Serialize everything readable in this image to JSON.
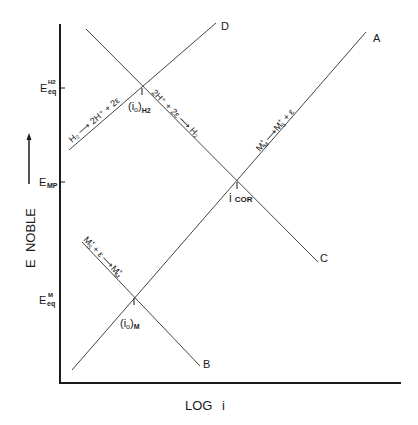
{
  "diagram": {
    "type": "evans-diagram",
    "axes": {
      "x_label": "LOG i",
      "y_label": "E  NOBLE",
      "y_ticks": [
        {
          "id": "eeq_h2",
          "main": "E",
          "sup": "H2",
          "sub": "eq",
          "y": 88
        },
        {
          "id": "emp",
          "main": "E",
          "sub": "MP",
          "y": 182
        },
        {
          "id": "eeq_m",
          "main": "E",
          "sup": "M",
          "sub": "eq",
          "y": 298
        }
      ]
    },
    "lines": [
      {
        "id": "A",
        "label": "A",
        "from": [
          72,
          370
        ],
        "to": [
          366,
          32
        ],
        "reaction": {
          "lhs": "M",
          "lhs_sup": "+",
          "lhs_sub": "M",
          "arrow": "⟶",
          "rhs": "M",
          "rhs_sup": "+",
          "rhs_sub": "S",
          "tail": "+ ε"
        }
      },
      {
        "id": "B",
        "label": "B",
        "from": [
          82,
          242
        ],
        "to": [
          200,
          366
        ],
        "reaction": {
          "lhs": "M",
          "lhs_sup": "+",
          "lhs_sub": "S",
          "mid": "+ ε",
          "arrow": "⟶",
          "rhs": "M",
          "rhs_sup": "+",
          "rhs_sub": "M"
        }
      },
      {
        "id": "C",
        "label": "C",
        "from": [
          86,
          29
        ],
        "to": [
          318,
          262
        ],
        "reaction": {
          "text": "2H⁺ + 2ε ⟶ H₂"
        }
      },
      {
        "id": "D",
        "label": "D",
        "from": [
          69,
          150
        ],
        "to": [
          216,
          23
        ],
        "reaction": {
          "text": "H₂ ⟶ 2H⁺ + 2ε"
        }
      }
    ],
    "points": [
      {
        "id": "io_h2",
        "label": "(i",
        "sub0": "o",
        "close": ")",
        "sub": "H2",
        "x": 142,
        "y": 88
      },
      {
        "id": "icor",
        "label": "i",
        "sub": "COR",
        "x": 237,
        "y": 182
      },
      {
        "id": "io_m",
        "label": "(i",
        "sub0": "o",
        "close": ")",
        "sub": "M",
        "x": 134,
        "y": 298
      }
    ]
  }
}
